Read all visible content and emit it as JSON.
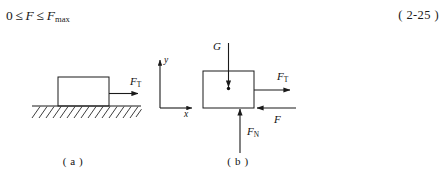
{
  "equation": {
    "lhs_value": "0",
    "relation_1": "≤",
    "variable": "F",
    "relation_2": "≤",
    "variable_max": "F",
    "variable_max_sub": "max",
    "number": "( 2-25 )"
  },
  "figure": {
    "panel_a": {
      "caption": "( a )",
      "description": "block resting on hatched ground with applied pulling force",
      "forces": [
        {
          "symbol": "F",
          "subscript": "T",
          "direction": "right"
        }
      ],
      "ground": {
        "hatched": true
      }
    },
    "axes": {
      "y_label": "y",
      "x_label": "x",
      "origin_description": "coordinate axes between panels"
    },
    "panel_b": {
      "caption": "( b )",
      "description": "free body diagram of the block",
      "forces": [
        {
          "symbol": "G",
          "subscript": "",
          "direction": "down"
        },
        {
          "symbol": "F",
          "subscript": "N",
          "direction": "up"
        },
        {
          "symbol": "F",
          "subscript": "T",
          "direction": "right"
        },
        {
          "symbol": "F",
          "subscript": "",
          "direction": "left"
        }
      ]
    }
  },
  "colors": {
    "ink": "#1a1a1a",
    "paper": "#ffffff"
  }
}
